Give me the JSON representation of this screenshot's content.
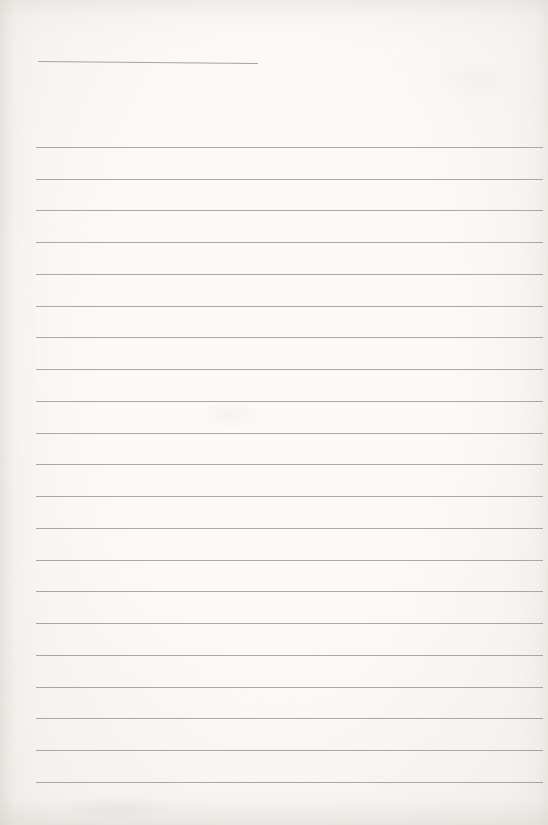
{
  "page": {
    "kind": "blank-lined-notebook-page",
    "background_center_color": "#fbfaf7",
    "background_edge_color": "#f2f0ec",
    "rule_line_color": "#97958f",
    "title_underline": {
      "present": true,
      "text": ""
    },
    "ruled_lines": {
      "count": 21,
      "text_content": []
    }
  }
}
